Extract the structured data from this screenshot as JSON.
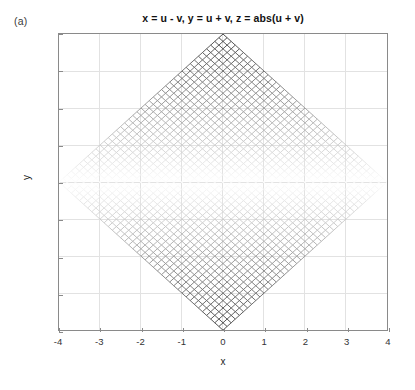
{
  "figure": {
    "panel_label": "(a)",
    "background_color": "#ffffff",
    "axis_color": "#8a8a8a",
    "grid_color": "#e2e2e2"
  },
  "chart_data": {
    "type": "line",
    "render_style": "mesh-wireframe",
    "title": "x = u - v, y = u + v, z = abs(u + v)",
    "xlabel": "x",
    "ylabel": "y",
    "xlim": [
      -4,
      4
    ],
    "ylim": [
      -4,
      4
    ],
    "xticks": [
      -4,
      -3,
      -2,
      -1,
      0,
      1,
      2,
      3,
      4
    ],
    "yticks": [
      -4,
      -3,
      -2,
      -1,
      0,
      1,
      2,
      3,
      4
    ],
    "xticklabels": [
      "-4",
      "-3",
      "-2",
      "-1",
      "0",
      "1",
      "2",
      "3",
      "4"
    ],
    "yticklabels": [
      "-4",
      "-3",
      "-2",
      "-1",
      "0",
      "1",
      "2",
      "3",
      "4"
    ],
    "grid": true,
    "legend": null,
    "equations": {
      "x": "u - v",
      "y": "u + v",
      "z": "abs(u + v)"
    },
    "parameters": {
      "u_range": [
        -2,
        2
      ],
      "v_range": [
        -2,
        2
      ],
      "u_steps": 41,
      "v_steps": 41
    },
    "geometry": {
      "shape": "rotated square (diamond)",
      "vertices": [
        [
          -4,
          0
        ],
        [
          0,
          4
        ],
        [
          4,
          0
        ],
        [
          0,
          -4
        ]
      ],
      "mesh_rotation_deg": 45,
      "mesh_line_count_per_direction": 41
    },
    "colormap": {
      "name": "gray-inverted",
      "mapped_variable": "z = abs(u + v) = abs(y)",
      "z_min": 0,
      "z_max": 4,
      "color_at_zmin": "#ffffff",
      "color_at_zmax": "#2b2b2b",
      "note": "darkest at |y| = 4 (left, right, top and bottom extremes of mesh lines); lightest band along y = 0"
    },
    "edge_color": "#333333",
    "face_color": "#ffffff"
  }
}
